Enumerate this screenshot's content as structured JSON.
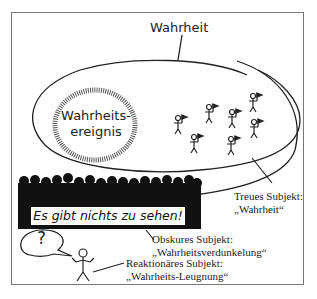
{
  "diagram": {
    "top_label": "Wahrheit",
    "event_label_line1": "Wahrheits-",
    "event_label_line2": "ereignis",
    "banner_text": "Es gibt nichts zu sehen!",
    "speech_bubble": "?",
    "subjects": [
      {
        "title": "Treues Subjekt:",
        "quote": "„Wahrheit“"
      },
      {
        "title": "Obskures Subjekt:",
        "quote": "„Wahrheitsverdunkelung“"
      },
      {
        "title": "Reaktionäres Subjekt:",
        "quote": "„Wahrheits-Leugnung“"
      }
    ]
  }
}
